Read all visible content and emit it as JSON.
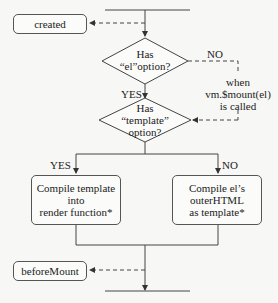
{
  "diagram": {
    "hooks": {
      "created": "created",
      "beforeMount": "beforeMount"
    },
    "decisions": {
      "el_option": {
        "line1": "Has",
        "line2": "“el”option?"
      },
      "template_option": {
        "line1": "Has",
        "line2": "“template”",
        "line3": "option?"
      }
    },
    "labels": {
      "yes1": "YES",
      "no1": "NO",
      "yes2": "YES",
      "no2": "NO",
      "when1": "when",
      "when2": "vm.$mount(el)",
      "when3": "is called"
    },
    "processes": {
      "compile_template": {
        "line1": "Compile template",
        "line2": "into",
        "line3": "render function*"
      },
      "compile_el": {
        "line1": "Compile el’s",
        "line2": "outerHTML",
        "line3": "as template*"
      }
    },
    "colors": {
      "line": "#444444",
      "background": "#f7f7f5"
    }
  }
}
